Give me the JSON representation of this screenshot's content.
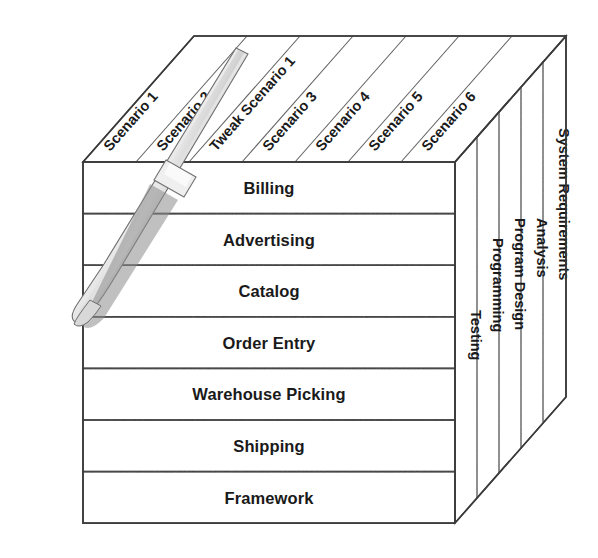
{
  "diagram": {
    "type": "3d-cube-matrix",
    "colors": {
      "background": "#ffffff",
      "edge": "#3a3a3a",
      "divider": "#4a4a4a",
      "top_face": "#f4f4f4",
      "side_face": "#b4b4b4",
      "text": "#1a1a1a",
      "blade_light": "#e8e8e8",
      "blade_mid": "#9a9a9a",
      "blade_dark": "#6a6a6a"
    },
    "front_face": {
      "axis_name": "Features",
      "rows": [
        {
          "label": "Billing",
          "fill": "#f2f2f2"
        },
        {
          "label": "Advertising",
          "fill": "#eeeeee"
        },
        {
          "label": "Catalog",
          "fill": "#e6e6e6"
        },
        {
          "label": "Order Entry",
          "fill": "#dddddd"
        },
        {
          "label": "Warehouse Picking",
          "fill": "#d2d2d2"
        },
        {
          "label": "Shipping",
          "fill": "#c6c6c6"
        },
        {
          "label": "Framework",
          "fill": "#bcbcbc"
        }
      ]
    },
    "top_face": {
      "axis_name": "Scenarios",
      "columns": [
        {
          "label": "Scenario 1"
        },
        {
          "label": "Scenario 2"
        },
        {
          "label": "Tweak Scenario 1"
        },
        {
          "label": "Scenario 3"
        },
        {
          "label": "Scenario 4"
        },
        {
          "label": "Scenario 5"
        },
        {
          "label": "Scenario 6"
        }
      ]
    },
    "right_face": {
      "axis_name": "Activities",
      "columns": [
        {
          "label": "Testing",
          "fill": "#b0b0b0"
        },
        {
          "label": "Programming",
          "fill": "#b4b4b4"
        },
        {
          "label": "Program Design",
          "fill": "#b8b8b8"
        },
        {
          "label": "Analysis",
          "fill": "#bcbcbc"
        },
        {
          "label": "System Requirements",
          "fill": "#c0c0c0"
        }
      ]
    },
    "decoration": {
      "knife": "knife-blade-slicing-cube"
    }
  }
}
